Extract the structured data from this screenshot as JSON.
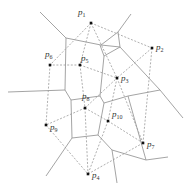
{
  "diagram": {
    "sites": [
      {
        "id": "p1",
        "label": "p",
        "sub": "1",
        "x": 91,
        "y": 23,
        "lx": 78,
        "ly": 15
      },
      {
        "id": "p2",
        "label": "p",
        "sub": "2",
        "x": 152,
        "y": 48,
        "lx": 156,
        "ly": 50
      },
      {
        "id": "p3",
        "label": "p",
        "sub": "3",
        "x": 117,
        "y": 78,
        "lx": 121,
        "ly": 81
      },
      {
        "id": "p4",
        "label": "p",
        "sub": "4",
        "x": 88,
        "y": 174,
        "lx": 92,
        "ly": 178
      },
      {
        "id": "p5",
        "label": "p",
        "sub": "5",
        "x": 80,
        "y": 65,
        "lx": 81,
        "ly": 61
      },
      {
        "id": "p6",
        "label": "p",
        "sub": "6",
        "x": 50,
        "y": 65,
        "lx": 45,
        "ly": 57
      },
      {
        "id": "p7",
        "label": "p",
        "sub": "7",
        "x": 143,
        "y": 143,
        "lx": 147,
        "ly": 147
      },
      {
        "id": "p8",
        "label": "p",
        "sub": "8",
        "x": 85,
        "y": 108,
        "lx": 82,
        "ly": 99
      },
      {
        "id": "p9",
        "label": "p",
        "sub": "9",
        "x": 46,
        "y": 125,
        "lx": 50,
        "ly": 130
      },
      {
        "id": "p10",
        "label": "p",
        "sub": "10",
        "x": 108,
        "y": 121,
        "lx": 112,
        "ly": 117
      }
    ],
    "voronoi_edges": [
      [
        40,
        12,
        66,
        38
      ],
      [
        66,
        38,
        101,
        45
      ],
      [
        101,
        45,
        118,
        32
      ],
      [
        118,
        32,
        131,
        14
      ],
      [
        101,
        45,
        120,
        47
      ],
      [
        118,
        32,
        120,
        47
      ],
      [
        120,
        47,
        160,
        90
      ],
      [
        160,
        90,
        183,
        118
      ],
      [
        66,
        38,
        65,
        90
      ],
      [
        65,
        90,
        8,
        92
      ],
      [
        65,
        90,
        71,
        100
      ],
      [
        71,
        100,
        100,
        96
      ],
      [
        100,
        96,
        104,
        56
      ],
      [
        104,
        56,
        120,
        47
      ],
      [
        100,
        96,
        104,
        103
      ],
      [
        104,
        103,
        128,
        96
      ],
      [
        128,
        96,
        160,
        90
      ],
      [
        71,
        100,
        72,
        138
      ],
      [
        72,
        138,
        46,
        176
      ],
      [
        72,
        138,
        98,
        135
      ],
      [
        98,
        135,
        104,
        103
      ],
      [
        98,
        135,
        112,
        150
      ],
      [
        112,
        150,
        146,
        160
      ],
      [
        146,
        160,
        168,
        157
      ],
      [
        146,
        160,
        128,
        96
      ],
      [
        112,
        150,
        117,
        183
      ],
      [
        104,
        56,
        100,
        45
      ]
    ],
    "delaunay_edges": [
      [
        "p1",
        "p2"
      ],
      [
        "p1",
        "p5"
      ],
      [
        "p1",
        "p6"
      ],
      [
        "p1",
        "p3"
      ],
      [
        "p2",
        "p3"
      ],
      [
        "p2",
        "p7"
      ],
      [
        "p5",
        "p6"
      ],
      [
        "p5",
        "p3"
      ],
      [
        "p5",
        "p8"
      ],
      [
        "p6",
        "p9"
      ],
      [
        "p8",
        "p3"
      ],
      [
        "p8",
        "p9"
      ],
      [
        "p8",
        "p10"
      ],
      [
        "p3",
        "p10"
      ],
      [
        "p3",
        "p7"
      ],
      [
        "p10",
        "p7"
      ],
      [
        "p10",
        "p4"
      ],
      [
        "p9",
        "p4"
      ],
      [
        "p4",
        "p7"
      ],
      [
        "p8",
        "p4"
      ]
    ]
  }
}
